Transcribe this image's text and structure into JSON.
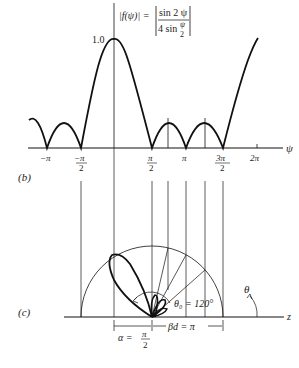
{
  "figure": {
    "panel_b": {
      "label": "(b)",
      "equation": {
        "lhs": "|f(ψ)| =",
        "num": "sin 2 ψ",
        "den_a": "4 sin",
        "den_frac_num": "ψ",
        "den_frac_den": "2"
      },
      "y_peak_label": "1.0",
      "x_axis_label": "ψ",
      "ticks": [
        {
          "num": "−π",
          "den": ""
        },
        {
          "num": "−π",
          "den": "2"
        },
        {
          "num": "π",
          "den": "2"
        },
        {
          "num": "π",
          "den": ""
        },
        {
          "num": "3π",
          "den": "2"
        },
        {
          "num": "2π",
          "den": ""
        }
      ]
    },
    "panel_c": {
      "label": "(c)",
      "theta0": "θ₀ = 120°",
      "theta": "θ",
      "z_label": "z",
      "alpha_lhs": "α =",
      "alpha_num": "π",
      "alpha_den": "2",
      "bd": "βd = π"
    }
  }
}
